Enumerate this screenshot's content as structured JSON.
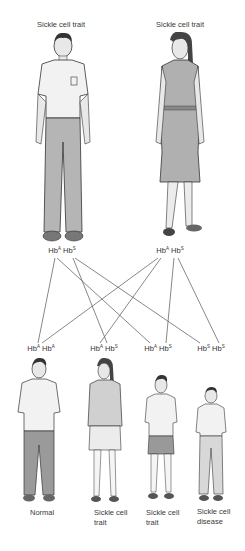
{
  "parents": [
    {
      "label": "Sickle cell trait",
      "role": "father",
      "genotype": {
        "allele1": "A",
        "allele2": "S"
      }
    },
    {
      "label": "Sickle cell trait",
      "role": "mother",
      "genotype": {
        "allele1": "A",
        "allele2": "S"
      }
    }
  ],
  "allele_prefix": "Hb",
  "children": [
    {
      "genotype": {
        "allele1": "A",
        "allele2": "A"
      },
      "label_line1": "Normal",
      "label_line2": ""
    },
    {
      "genotype": {
        "allele1": "A",
        "allele2": "S"
      },
      "label_line1": "Sickle cell",
      "label_line2": "trait"
    },
    {
      "genotype": {
        "allele1": "A",
        "allele2": "S"
      },
      "label_line1": "Sickle cell",
      "label_line2": "trait"
    },
    {
      "genotype": {
        "allele1": "S",
        "allele2": "S"
      },
      "label_line1": "Sickle cell",
      "label_line2": "disease"
    }
  ],
  "colors": {
    "line": "#555555",
    "figure_stroke": "#333333",
    "figure_fill": "#d9d9d9"
  }
}
